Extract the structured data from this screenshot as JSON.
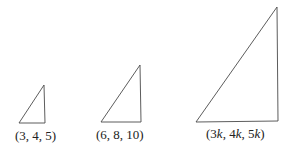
{
  "figure": {
    "stroke_color": "#4a4a4a",
    "triangles": [
      {
        "label": "(3, 4, 5)",
        "points": "19,123 45,123 44,85"
      },
      {
        "label": "(6, 8, 10)",
        "points": "101,122 141,122 140,65"
      },
      {
        "label_parts": [
          "(3",
          "k",
          ", 4",
          "k",
          ", 5",
          "k",
          ")"
        ],
        "points": "196,122 278,121 277,7"
      }
    ]
  }
}
